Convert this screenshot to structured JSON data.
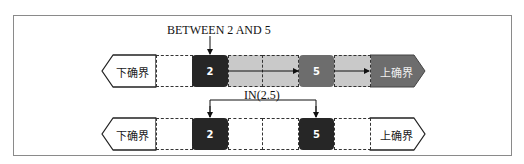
{
  "diagram": {
    "row1": {
      "annotation": "BETWEEN 2 AND 5",
      "lower_bound": "下确界",
      "upper_bound": "上确界",
      "values": [
        "2",
        "5"
      ],
      "colors": {
        "box_start": "#262626",
        "box_end": "#6d6d6d",
        "range_fill": "#c9c9c9",
        "upper_pill": "#6d6d6d"
      }
    },
    "row2": {
      "annotation": "IN(2.5)",
      "lower_bound": "下确界",
      "upper_bound": "上确界",
      "values": [
        "2",
        "5"
      ],
      "colors": {
        "box": "#262626",
        "fill": "#ffffff"
      }
    }
  }
}
